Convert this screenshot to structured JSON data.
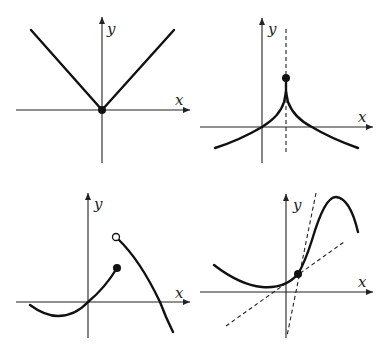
{
  "figure": {
    "panels": [
      {
        "id": "top-left",
        "description": "Absolute value function with corner at origin",
        "x_label": "x",
        "y_label": "y",
        "marker": "filled point at origin"
      },
      {
        "id": "top-right",
        "description": "Cusp at x = a with vertical dashed line; filled point above cusp",
        "x_label": "x",
        "y_label": "y",
        "marker": "filled point above cusp"
      },
      {
        "id": "bottom-left",
        "description": "Jump discontinuity: filled endpoint on left branch, open circle on right branch",
        "x_label": "x",
        "y_label": "y",
        "marker": "filled and open circles"
      },
      {
        "id": "bottom-right",
        "description": "Smooth curve with point where two dashed tangent-like lines intersect",
        "x_label": "x",
        "y_label": "y",
        "marker": "filled point at intersection"
      }
    ]
  },
  "colors": {
    "curve": "#111111",
    "axis": "#222222",
    "background": "#ffffff"
  }
}
